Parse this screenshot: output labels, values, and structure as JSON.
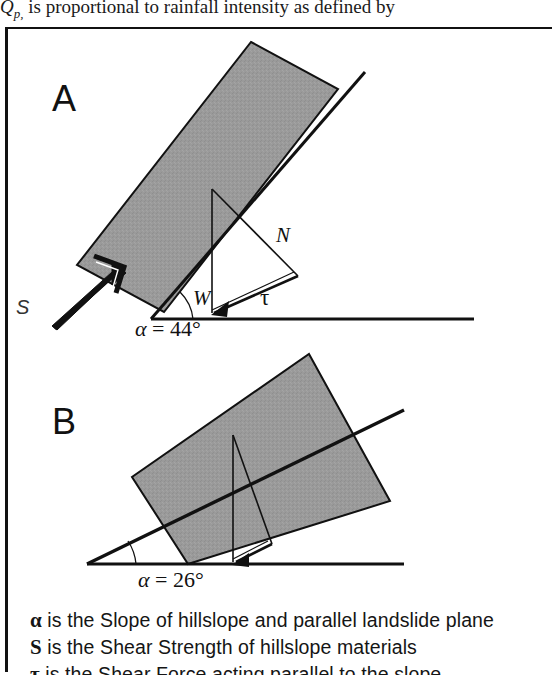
{
  "top_text": {
    "symbol": "Q",
    "subscript": "p,",
    "sentence": " is proportional to rainfall intensity as defined by"
  },
  "figure": {
    "panel_a": {
      "letter": "A",
      "angle_symbol": "α",
      "angle_text": "= 44°",
      "angle_value": 44,
      "angle_full": "α = 44°",
      "vectors": [
        {
          "name": "N",
          "label": "N",
          "meaning": "normal-force"
        },
        {
          "name": "W",
          "label": "W",
          "meaning": "weight"
        },
        {
          "name": "tau",
          "label": "τ",
          "meaning": "shear-force"
        }
      ],
      "shear_strength_label": "S"
    },
    "panel_b": {
      "letter": "B",
      "angle_symbol": "α",
      "angle_text": "= 26°",
      "angle_value": 26,
      "angle_full": "α = 26°"
    },
    "colors": {
      "block_fill": "#9a9a9a",
      "line": "#111111",
      "background": "#ffffff"
    }
  },
  "caption": {
    "lines": [
      {
        "glyph": "α",
        "text": " is the Slope of hillslope and parallel landslide plane"
      },
      {
        "glyph": "S",
        "text": " is the Shear Strength of hillslope materials"
      },
      {
        "glyph": "τ",
        "text": " is the Shear Force acting parallel to the slope"
      }
    ]
  }
}
